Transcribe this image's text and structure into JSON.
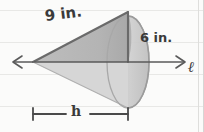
{
  "figure": {
    "title_alt": "Sideways cone resting on line l with slant height, radius and height labeled",
    "shape": "cone",
    "background": "ruled-notebook-paper",
    "colors": {
      "paper": "#fbfbfa",
      "rule_line": "#e6e6e4",
      "border_line": "#dddddb",
      "cone_upper_fill": "#b7b7b7",
      "cone_lower_fill": "#d9d9d9",
      "cone_base_fill": "#c9c9c9",
      "cone_shadow_fill": "#cccccc",
      "outline": "#6e6e6e",
      "axis_line": "#5a5a5a",
      "text": "#3a3a3a"
    }
  },
  "labels": {
    "slant_height": "9 in.",
    "radius": "6 in.",
    "line_name": "ℓ",
    "height": "h"
  },
  "measurements": {
    "slant_height_value": 9,
    "slant_height_unit": "in.",
    "radius_value": 6,
    "radius_unit": "in.",
    "height_value": "h"
  },
  "annotations": {
    "axis": "double-headed horizontal line labeled l",
    "height_bar": "tick-ended dimension bar spanning cone apex to base, labeled h"
  }
}
